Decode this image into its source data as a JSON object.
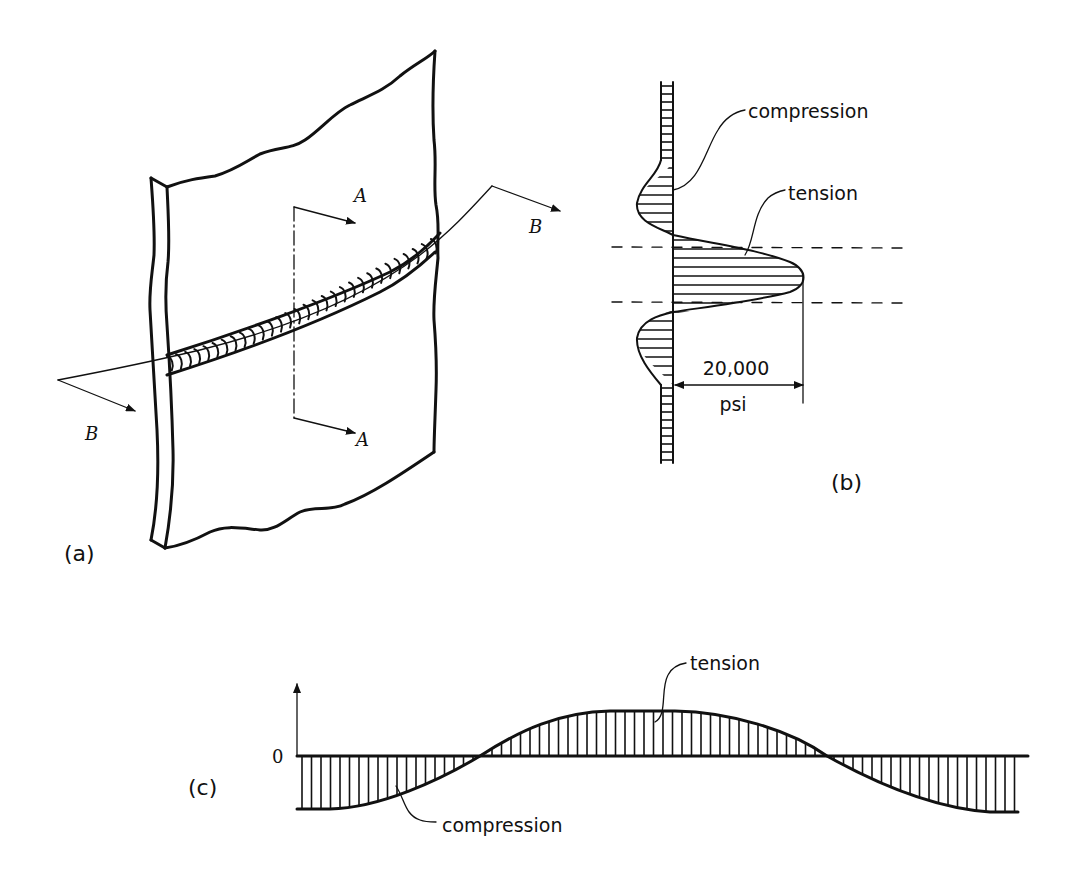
{
  "figure": {
    "colors": {
      "ink": "#111111",
      "background": "#ffffff"
    }
  },
  "panel_a": {
    "label": "(a)",
    "section_a_labels": [
      "A",
      "A"
    ],
    "section_b_labels": [
      "B",
      "B"
    ]
  },
  "panel_b": {
    "label": "(b)",
    "compression_label": "compression",
    "tension_label": "tension",
    "dimension_value": "20,000",
    "dimension_unit": "psi"
  },
  "panel_c": {
    "label": "(c)",
    "zero_label": "0",
    "tension_label": "tension",
    "compression_label": "compression"
  }
}
